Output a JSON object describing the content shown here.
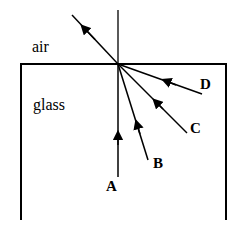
{
  "media": {
    "top": "air",
    "bottom": "glass"
  },
  "rays": [
    {
      "label": "A",
      "x": 118,
      "y": 177
    },
    {
      "label": "B",
      "x": 148,
      "y": 160
    },
    {
      "label": "C",
      "x": 187,
      "y": 133
    },
    {
      "label": "D",
      "x": 202,
      "y": 94
    }
  ],
  "colors": {
    "line": "#000000",
    "background": "#ffffff"
  }
}
